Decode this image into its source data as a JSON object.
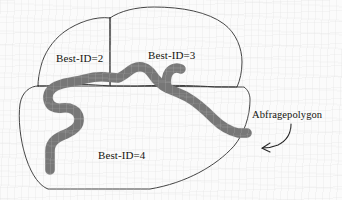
{
  "figure": {
    "background_color": "#fbfbfb",
    "polyline_fill": "#7a7a7a",
    "polyline_stroke": "#3b3b3b",
    "polygon_stroke": "#2b2b2b"
  },
  "labels": {
    "region_2": "Best-ID=2",
    "region_3": "Best-ID=3",
    "region_4": "Best-ID=4",
    "query_polygon": "Abfragepolygon"
  },
  "annotations": {
    "arrow_name": "curved-arrow",
    "arrow_points_to": "Abfragepolygon"
  },
  "regions": [
    {
      "id": "2",
      "label": "Best-ID=2",
      "position": "upper-left"
    },
    {
      "id": "3",
      "label": "Best-ID=3",
      "position": "upper-right"
    },
    {
      "id": "4",
      "label": "Best-ID=4",
      "position": "lower"
    }
  ]
}
